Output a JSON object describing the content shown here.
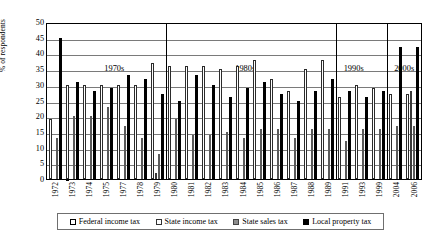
{
  "chart_data": {
    "type": "bar",
    "title": "",
    "xlabel": "",
    "ylabel": "% of respondents",
    "ylim": [
      0,
      50
    ],
    "ytick_step": 5,
    "yticks": [
      "0",
      "5",
      "10",
      "15",
      "20",
      "25",
      "30",
      "35",
      "40",
      "45",
      "50"
    ],
    "grid": true,
    "legend_position": "bottom",
    "categories": [
      "1972",
      "1973",
      "1974",
      "1975",
      "1977",
      "1978",
      "1979",
      "1980",
      "1981",
      "1982",
      "1983",
      "1984",
      "1985",
      "1986",
      "1987",
      "1988",
      "1989",
      "1991",
      "1993",
      "1999",
      "2004",
      "2006"
    ],
    "series": [
      {
        "name": "Federal income tax",
        "color": "#ffffff",
        "values": [
          19,
          30,
          30,
          30,
          30,
          30,
          37,
          36,
          36,
          36,
          35,
          36,
          38,
          32,
          28,
          35,
          38,
          26,
          30,
          29,
          27,
          27
        ]
      },
      {
        "name": "State income tax",
        "color": "#fdfdfd",
        "values": [
          0,
          0,
          0,
          0,
          0,
          0,
          2,
          0,
          0,
          0,
          0,
          0,
          0,
          0,
          0,
          0,
          0,
          0,
          0,
          0,
          0,
          28
        ]
      },
      {
        "name": "State sales tax",
        "color": "#8d8d8d",
        "values": [
          13,
          20,
          20,
          23,
          17,
          13,
          8,
          19,
          14,
          14,
          15,
          13,
          16,
          16,
          13,
          16,
          16,
          12,
          16,
          16,
          17,
          17
        ]
      },
      {
        "name": "Local property tax",
        "color": "#000000",
        "values": [
          45,
          31,
          28,
          29,
          33,
          32,
          27,
          25,
          33,
          30,
          26,
          29,
          31,
          27,
          25,
          28,
          32,
          28,
          26,
          28,
          42,
          42
        ]
      }
    ],
    "annotations": [
      {
        "label": "1970s",
        "position_fraction": 0.18
      },
      {
        "label": "1980s",
        "position_fraction": 0.53
      },
      {
        "label": "1990s",
        "position_fraction": 0.82
      },
      {
        "label": "2000s",
        "position_fraction": 0.955
      }
    ],
    "group_separators": [
      0.3182,
      0.7727,
      0.9091
    ]
  },
  "legend": {
    "items": [
      {
        "label": "Federal income tax",
        "swatch": "sw0"
      },
      {
        "label": "State income tax",
        "swatch": "sw1"
      },
      {
        "label": "State sales tax",
        "swatch": "sw2"
      },
      {
        "label": "Local property tax",
        "swatch": "sw3"
      }
    ]
  }
}
